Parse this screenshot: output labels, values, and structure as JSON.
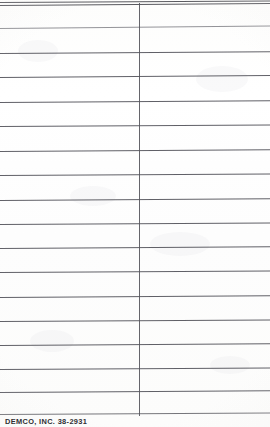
{
  "document": {
    "kind": "library-date-due-slip",
    "imprint": "DEMCO, INC. 38-2931",
    "width_px": 270,
    "height_px": 427,
    "background_color": "#fefefe",
    "rule_color": "#53535a",
    "divider_color": "#54545b",
    "imprint_color": "#2f2f33"
  },
  "divider": {
    "name": "vertical-column-divider",
    "x_px": 139,
    "top_px": 3,
    "bottom_px": 416
  },
  "rules": [
    {
      "id": 1,
      "y_px": 2,
      "tilt_deg": -0.3,
      "style": "top-border"
    },
    {
      "id": 2,
      "y_px": 5,
      "tilt_deg": -0.45,
      "style": "top-border"
    },
    {
      "id": 3,
      "y_px": 28,
      "tilt_deg": -0.55,
      "style": "faint"
    },
    {
      "id": 4,
      "y_px": 53,
      "tilt_deg": -0.35,
      "style": "normal"
    },
    {
      "id": 5,
      "y_px": 77,
      "tilt_deg": -0.4,
      "style": "normal"
    },
    {
      "id": 6,
      "y_px": 102,
      "tilt_deg": -0.35,
      "style": "normal"
    },
    {
      "id": 7,
      "y_px": 126,
      "tilt_deg": -0.3,
      "style": "normal"
    },
    {
      "id": 8,
      "y_px": 151,
      "tilt_deg": -0.35,
      "style": "normal"
    },
    {
      "id": 9,
      "y_px": 175,
      "tilt_deg": -0.3,
      "style": "normal"
    },
    {
      "id": 10,
      "y_px": 200,
      "tilt_deg": -0.35,
      "style": "normal"
    },
    {
      "id": 11,
      "y_px": 224,
      "tilt_deg": -0.3,
      "style": "normal"
    },
    {
      "id": 12,
      "y_px": 248,
      "tilt_deg": -0.35,
      "style": "normal"
    },
    {
      "id": 13,
      "y_px": 272,
      "tilt_deg": -0.3,
      "style": "normal"
    },
    {
      "id": 14,
      "y_px": 297,
      "tilt_deg": -0.35,
      "style": "normal"
    },
    {
      "id": 15,
      "y_px": 321,
      "tilt_deg": -0.3,
      "style": "normal"
    },
    {
      "id": 16,
      "y_px": 345,
      "tilt_deg": -0.35,
      "style": "normal"
    },
    {
      "id": 17,
      "y_px": 369,
      "tilt_deg": -0.3,
      "style": "normal"
    },
    {
      "id": 18,
      "y_px": 392,
      "tilt_deg": -0.35,
      "style": "normal"
    },
    {
      "id": 19,
      "y_px": 414,
      "tilt_deg": -0.3,
      "style": "thin"
    }
  ],
  "imprint_position": {
    "x_px": 5,
    "y_px": 417
  },
  "artifacts": [
    {
      "x_px": 18,
      "y_px": 40,
      "w_px": 40,
      "h_px": 22
    },
    {
      "x_px": 196,
      "y_px": 66,
      "w_px": 52,
      "h_px": 26
    },
    {
      "x_px": 70,
      "y_px": 186,
      "w_px": 46,
      "h_px": 20
    },
    {
      "x_px": 150,
      "y_px": 232,
      "w_px": 60,
      "h_px": 24
    },
    {
      "x_px": 30,
      "y_px": 330,
      "w_px": 44,
      "h_px": 22
    },
    {
      "x_px": 210,
      "y_px": 356,
      "w_px": 40,
      "h_px": 18
    }
  ]
}
